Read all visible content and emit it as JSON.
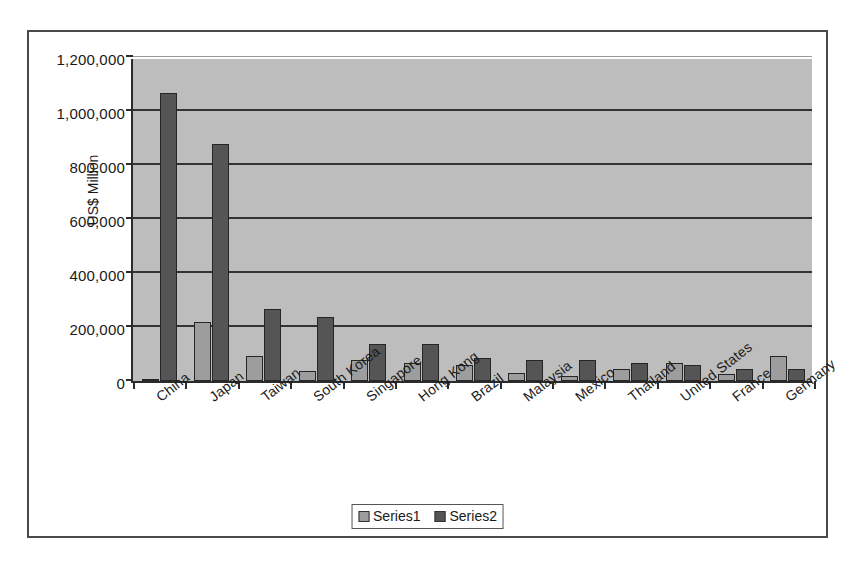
{
  "chart_data": {
    "type": "bar",
    "title": "",
    "xlabel": "",
    "ylabel": "US$ Million",
    "ylim": [
      0,
      1200000
    ],
    "ytick_values": [
      0,
      200000,
      400000,
      600000,
      800000,
      1000000,
      1200000
    ],
    "ytick_labels": [
      "0",
      "200,000",
      "400,000",
      "600,000",
      "800,000",
      "1,000,000",
      "1,200,000"
    ],
    "grid": true,
    "legend_position": "bottom",
    "categories": [
      "China",
      "Japan",
      "Taiwan",
      "South Korea",
      "Singapore",
      "Hong Kong",
      "Brazil",
      "Malaysia",
      "Mexico",
      "Thailand",
      "United States",
      "France",
      "Germany"
    ],
    "series": [
      {
        "name": "Series1",
        "color": "#9d9d9d",
        "values": [
          8000,
          220000,
          92000,
          38000,
          76000,
          65000,
          59000,
          29000,
          20000,
          44000,
          67000,
          26000,
          91000
        ]
      },
      {
        "name": "Series2",
        "color": "#555555",
        "values": [
          1065000,
          877000,
          265000,
          237000,
          136000,
          137000,
          87000,
          79000,
          78000,
          65000,
          60000,
          45000,
          44000
        ]
      }
    ]
  },
  "legend": {
    "entries": [
      {
        "label": "Series1"
      },
      {
        "label": "Series2"
      }
    ]
  },
  "colors": {
    "plot_background": "#bdbdbd",
    "frame_border": "#4a4a4a",
    "axis": "#2b2b2b",
    "gridline": "#333333",
    "series1": "#9d9d9d",
    "series2": "#555555"
  }
}
